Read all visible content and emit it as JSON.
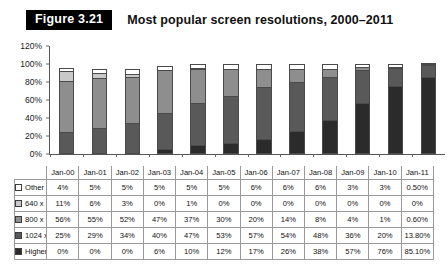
{
  "figure": {
    "badge_label": "Figure 3.21",
    "title": "Most popular screen resolutions, 2000–2011"
  },
  "chart_data": {
    "type": "bar",
    "subtype": "stacked-column",
    "title": "Most popular screen resolutions, 2000–2011",
    "xlabel": "",
    "ylabel": "",
    "ylim": [
      0,
      120
    ],
    "ytick_labels": [
      "0%",
      "20%",
      "40%",
      "60%",
      "80%",
      "100%",
      "120%"
    ],
    "ytick_values": [
      0,
      20,
      40,
      60,
      80,
      100,
      120
    ],
    "grid": false,
    "legend_position": "row-header-table",
    "categories": [
      "Jan-00",
      "Jan-01",
      "Jan-02",
      "Jan-03",
      "Jan-04",
      "Jan-05",
      "Jan-06",
      "Jan-07",
      "Jan-08",
      "Jan-09",
      "Jan-10",
      "Jan-11"
    ],
    "stack_order_bottom_to_top": [
      "Higher",
      "1024 x 768",
      "800 x 600",
      "640 x 480",
      "Other"
    ],
    "series": [
      {
        "name": "Other",
        "color": "#ffffff",
        "values": [
          4,
          5,
          5,
          5,
          5,
          5,
          6,
          6,
          6,
          3,
          3,
          0.5
        ],
        "labels": [
          "4%",
          "5%",
          "5%",
          "5%",
          "5%",
          "5%",
          "6%",
          "6%",
          "6%",
          "3%",
          "3%",
          "0.50%"
        ]
      },
      {
        "name": "640 x 480",
        "color": "#c9c9c9",
        "values": [
          11,
          6,
          3,
          0,
          1,
          0,
          0,
          0,
          0,
          0,
          0,
          0
        ],
        "labels": [
          "11%",
          "6%",
          "3%",
          "0%",
          "1%",
          "0%",
          "0%",
          "0%",
          "0%",
          "0%",
          "0%",
          "0%"
        ]
      },
      {
        "name": "800 x 600",
        "color": "#8e8e8e",
        "values": [
          56,
          55,
          52,
          47,
          37,
          30,
          20,
          14,
          8,
          4,
          1,
          0.6
        ],
        "labels": [
          "56%",
          "55%",
          "52%",
          "47%",
          "37%",
          "30%",
          "20%",
          "14%",
          "8%",
          "4%",
          "1%",
          "0.60%"
        ]
      },
      {
        "name": "1024 x 768",
        "color": "#595959",
        "values": [
          25,
          29,
          34,
          40,
          47,
          53,
          57,
          54,
          48,
          36,
          20,
          13.8
        ],
        "labels": [
          "25%",
          "29%",
          "34%",
          "40%",
          "47%",
          "53%",
          "57%",
          "54%",
          "48%",
          "36%",
          "20%",
          "13.80%"
        ]
      },
      {
        "name": "Higher",
        "color": "#2b2b2b",
        "values": [
          0,
          0,
          0,
          6,
          10,
          12,
          17,
          26,
          38,
          57,
          76,
          85.1
        ],
        "labels": [
          "0%",
          "0%",
          "0%",
          "6%",
          "10%",
          "12%",
          "17%",
          "26%",
          "38%",
          "57%",
          "76%",
          "85.10%"
        ]
      }
    ]
  }
}
